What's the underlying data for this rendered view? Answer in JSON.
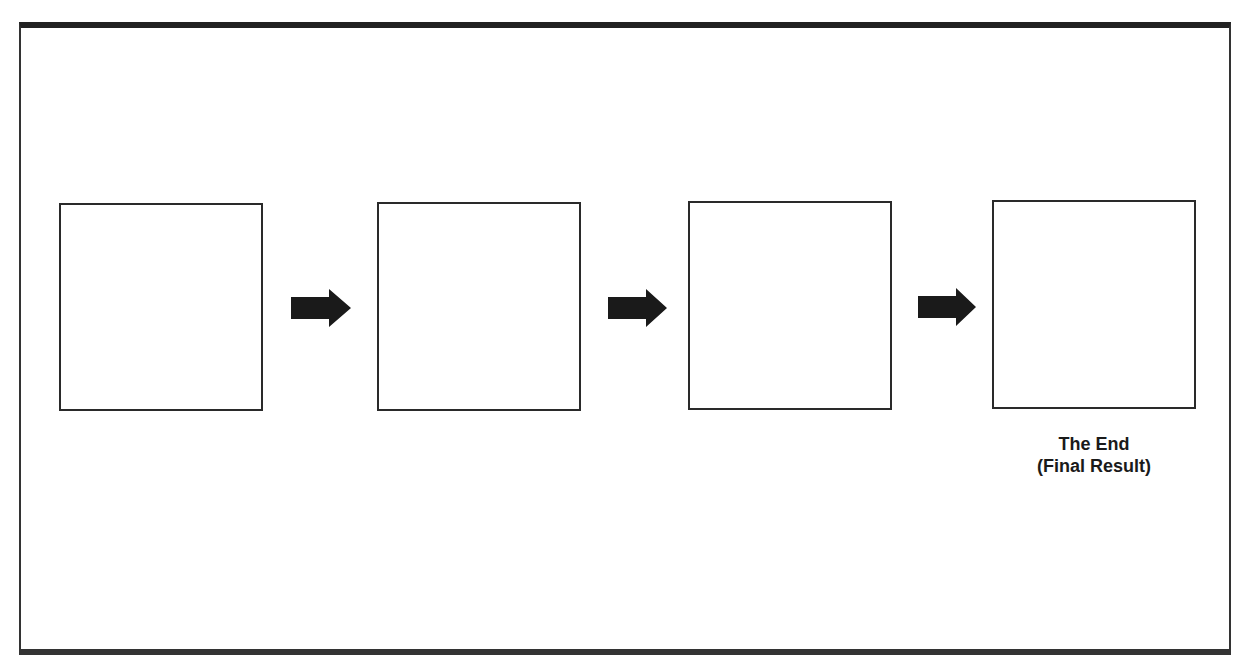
{
  "diagram": {
    "type": "sequential-flow",
    "steps": [
      {
        "index": 1,
        "label": ""
      },
      {
        "index": 2,
        "label": ""
      },
      {
        "index": 3,
        "label": ""
      },
      {
        "index": 4,
        "label": ""
      }
    ],
    "final_caption": {
      "line1": "The End",
      "line2": "(Final Result)"
    },
    "arrows": [
      {
        "from": 1,
        "to": 2,
        "icon": "right-arrow-icon"
      },
      {
        "from": 2,
        "to": 3,
        "icon": "right-arrow-icon"
      },
      {
        "from": 3,
        "to": 4,
        "icon": "right-arrow-icon"
      }
    ],
    "colors": {
      "stroke": "#2a2a2a",
      "arrow_fill": "#1a1a1a",
      "background": "#ffffff"
    }
  }
}
